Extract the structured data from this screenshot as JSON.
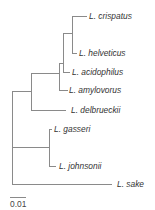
{
  "diagram": {
    "type": "phylogenetic-tree",
    "line_color": "#8a8a8a",
    "text_color": "#333333",
    "taxa": [
      {
        "name": "L. crispatus",
        "tip": [
          87,
          16
        ],
        "label_x": 89
      },
      {
        "name": "L. helveticus",
        "tip": [
          77,
          53
        ],
        "label_x": 79
      },
      {
        "name": "L. acidophilus",
        "tip": [
          70,
          72
        ],
        "label_x": 72
      },
      {
        "name": "L. amylovorus",
        "tip": [
          68,
          90
        ],
        "label_x": 69
      },
      {
        "name": "L. delbrueckii",
        "tip": [
          66,
          110
        ],
        "label_x": 71
      },
      {
        "name": "L. gasseri",
        "tip": [
          51,
          129
        ],
        "label_x": 54
      },
      {
        "name": "L. johnsonii",
        "tip": [
          56,
          166
        ],
        "label_x": 59
      },
      {
        "name": "L. sake",
        "tip": [
          112,
          184
        ],
        "label_x": 117
      }
    ],
    "scale_bar": {
      "label": "0.01",
      "x1": 10,
      "x2": 26,
      "y": 197
    }
  }
}
